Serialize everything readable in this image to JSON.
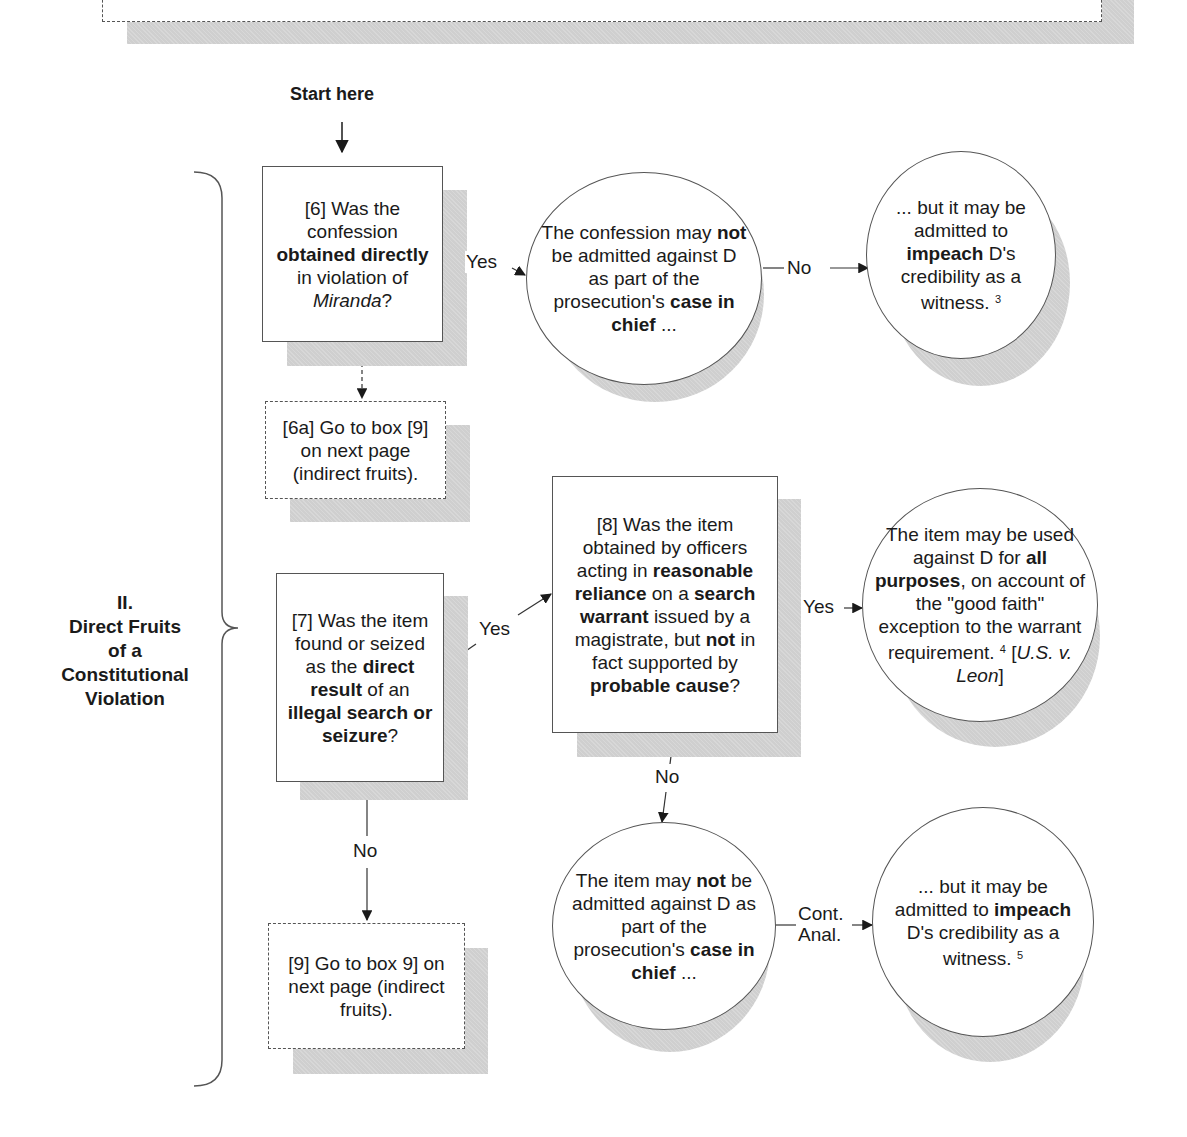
{
  "start_label": "Start here",
  "section": {
    "line1": "II.",
    "line2": "Direct Fruits",
    "line3": "of a",
    "line4": "Constitutional",
    "line5": "Violation"
  },
  "nodes": {
    "box6": {
      "id": "[6]",
      "t1": " Was the confession ",
      "b1": "obtained directly",
      "t2": " in violation of ",
      "i1": "Miranda",
      "t3": "?"
    },
    "box6a": {
      "text": "[6a] Go to box [9] on next page (indirect fruits)."
    },
    "circle_confession": {
      "t1": "The confession may ",
      "b1": "not",
      "t2": " be admitted against D as part of the prosecution's ",
      "b2": "case in chief",
      "t3": " ..."
    },
    "circle_impeach1": {
      "t1": "... but it may be admitted to ",
      "b1": "impeach",
      "t2": " D's credibility as a witness. ",
      "sup": "3"
    },
    "box7": {
      "id": "[7]",
      "t1": " Was the item found or seized as the ",
      "b1": "direct result",
      "t2": " of an ",
      "b2": "illegal search or seizure",
      "t3": "?"
    },
    "box8": {
      "t1": "[8] Was the item obtained by officers acting in ",
      "b1": "reasonable reliance",
      "t2": " on a ",
      "b2": "search warrant",
      "t3": " issued by a magistrate, but ",
      "b3": "not",
      "t4": " in fact supported by ",
      "b4": "probable cause",
      "t5": "?"
    },
    "circle_goodfaith": {
      "t1": "The item may be used against D for ",
      "b1": "all purposes",
      "t2": ", on account of the \"good faith\" exception to the warrant requirement. ",
      "sup": "4",
      "t3": " [",
      "i1": "U.S. v. Leon",
      "t4": "]"
    },
    "circle_item_not": {
      "t1": "The item may ",
      "b1": "not",
      "t2": " be admitted against D as part of the prosecution's ",
      "b2": "case in chief",
      "t3": " ..."
    },
    "circle_impeach2": {
      "t1": "... but it may be admitted to ",
      "b1": "impeach",
      "t2": " D's credibility as a witness. ",
      "sup": "5"
    },
    "box9": {
      "text": "[9] Go to box 9] on next page (indirect fruits)."
    }
  },
  "edges": {
    "yes_6": "Yes",
    "no_confession": "No",
    "yes_7": "Yes",
    "yes_8": "Yes",
    "no_8": "No",
    "no_7": "No",
    "cont_anal_1": "Cont.",
    "cont_anal_2": "Anal."
  },
  "colors": {
    "line": "#333333",
    "shadow": "#cfcfcf",
    "border": "#555555"
  }
}
